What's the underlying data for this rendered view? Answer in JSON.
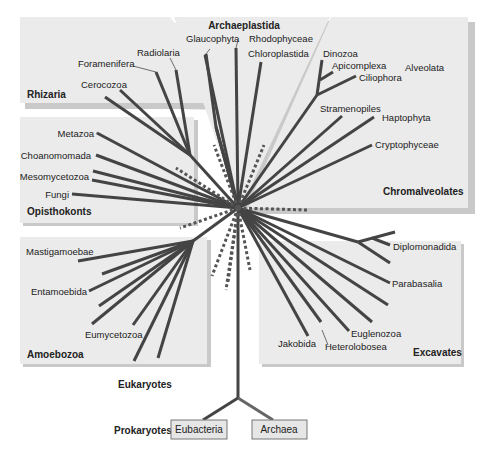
{
  "diagram": {
    "supergroups": [
      {
        "name": "Archaeplastida",
        "members": [
          "Glaucophyta",
          "Rhodophyceae",
          "Chloroplastida"
        ]
      },
      {
        "name": "Rhizaria",
        "members": [
          "Foramenifera",
          "Radiolaria",
          "Cerocozoa"
        ]
      },
      {
        "name": "Opisthokonts",
        "members": [
          "Metazoa",
          "Choanomomada",
          "Mesomycetozoa",
          "Fungi"
        ]
      },
      {
        "name": "Chromalveolates",
        "subgroup": "Alveolata",
        "members": [
          "Dinozoa",
          "Apicomplexa",
          "Ciliophora",
          "Stramenopiles",
          "Haptophyta",
          "Cryptophyceae"
        ]
      },
      {
        "name": "Amoebozoa",
        "members": [
          "Mastigamoebae",
          "Entamoebida",
          "Eumycetozoa"
        ]
      },
      {
        "name": "Excavates",
        "members": [
          "Diplomonadida",
          "Parabasalia",
          "Euglenozoa",
          "Heterolobosea",
          "Jakobida"
        ]
      }
    ],
    "domains": {
      "eukaryotes": "Eukaryotes",
      "prokaryotes": "Prokaryotes",
      "eubacteria": "Eubacteria",
      "archaea": "Archaea"
    },
    "labels": {
      "archaeplastida": "Archaeplastida",
      "glaucophyta": "Glaucophyta",
      "rhodophyceae": "Rhodophyceae",
      "chloroplastida": "Chloroplastida",
      "rhizaria": "Rhizaria",
      "foramenifera": "Foramenifera",
      "radiolaria": "Radiolaria",
      "cerocozoa": "Cerocozoa",
      "opisthokonts": "Opisthokonts",
      "metazoa": "Metazoa",
      "choanomomada": "Choanomomada",
      "mesomycetozoa": "Mesomycetozoa",
      "fungi": "Fungi",
      "chromalveolates": "Chromalveolates",
      "alveolata": "Alveolata",
      "dinozoa": "Dinozoa",
      "apicomplexa": "Apicomplexa",
      "ciliophora": "Ciliophora",
      "stramenopiles": "Stramenopiles",
      "haptophyta": "Haptophyta",
      "cryptophyceae": "Cryptophyceae",
      "amoebozoa": "Amoebozoa",
      "mastigamoebae": "Mastigamoebae",
      "entamoebida": "Entamoebida",
      "eumycetozoa": "Eumycetozoa",
      "excavates": "Excavates",
      "diplomonadida": "Diplomonadida",
      "parabasalia": "Parabasalia",
      "euglenozoa": "Euglenozoa",
      "heterolobosea": "Heterolobosea",
      "jakobida": "Jakobida"
    },
    "colors": {
      "panel": "#ebebeb",
      "branch": "#444444",
      "box": "#e6e6e6"
    }
  }
}
